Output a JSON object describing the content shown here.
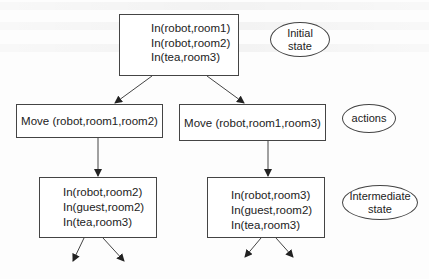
{
  "diagram": {
    "initial_state": {
      "lines": [
        "In(robot,room1)",
        "In(robot,room2)",
        "In(tea,room3)"
      ]
    },
    "actions": [
      {
        "label": "Move (robot,room1,room2)"
      },
      {
        "label": "Move (robot,room1,room3)"
      }
    ],
    "intermediate_states": [
      {
        "lines": [
          "In(robot,room2)",
          "In(guest,room2)",
          "In(tea,room3)"
        ]
      },
      {
        "lines": [
          "In(robot,room3)",
          "In(guest,room2)",
          "In(tea,room3)"
        ]
      }
    ],
    "legend": {
      "initial": "Initial\nstate",
      "actions": "actions",
      "intermediate": "Intermediate\nstate"
    }
  },
  "colors": {
    "line": "#444444",
    "background": "#fdfdfd"
  }
}
